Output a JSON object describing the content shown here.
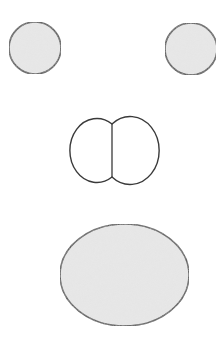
{
  "diagram": {
    "colors": {
      "background": "#ffffff",
      "stroke": "#3a3a3a",
      "shaded_fill": "#e4e4e4",
      "unfilled": "#ffffff"
    },
    "shapes": [
      {
        "id": "left-circle",
        "type": "circle",
        "cx": 35,
        "cy": 48,
        "r": 26,
        "filled": true
      },
      {
        "id": "right-circle",
        "type": "circle",
        "cx": 191,
        "cy": 49,
        "r": 26,
        "filled": true
      },
      {
        "id": "double-lobe",
        "type": "double-ellipse",
        "left_lobe": {
          "cx": 88,
          "cy": 150,
          "rx": 27,
          "ry": 32
        },
        "right_lobe": {
          "cx": 141,
          "cy": 150,
          "rx": 29,
          "ry": 34
        },
        "divider_x": 112,
        "filled": false
      },
      {
        "id": "bottom-ellipse",
        "type": "ellipse",
        "cx": 124.5,
        "cy": 275,
        "rx": 64.5,
        "ry": 51,
        "filled": true
      }
    ]
  }
}
